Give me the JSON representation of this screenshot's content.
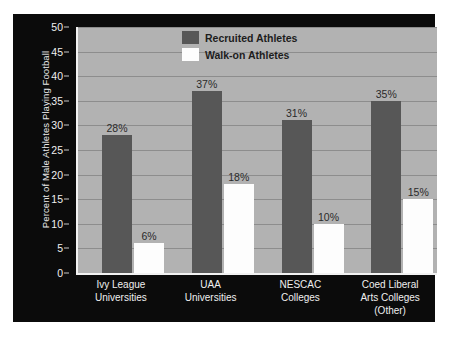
{
  "chart_data": {
    "type": "bar",
    "title": "",
    "subtitle": "",
    "xlabel": "",
    "ylabel": "Percent of Male Athletes Playing Football",
    "ylim": [
      0,
      50
    ],
    "ytick_step": 5,
    "yticks": [
      "0",
      "5",
      "10",
      "15",
      "20",
      "25",
      "30",
      "35",
      "40",
      "45",
      "50"
    ],
    "grid": true,
    "legend_position": "top-center",
    "categories": [
      "Ivy League Universities",
      "UAA Universities",
      "NESCAC Colleges",
      "Coed Liberal Arts Colleges (Other)"
    ],
    "category_lines": [
      [
        "Ivy League",
        "Universities"
      ],
      [
        "UAA",
        "Universities"
      ],
      [
        "NESCAC",
        "Colleges"
      ],
      [
        "Coed Liberal",
        "Arts Colleges",
        "(Other)"
      ]
    ],
    "series": [
      {
        "name": "Recruited Athletes",
        "color": "#575757",
        "values": [
          28,
          37,
          31,
          35
        ],
        "labels": [
          "28%",
          "37%",
          "31%",
          "35%"
        ]
      },
      {
        "name": "Walk-on Athletes",
        "color": "#fdfdfd",
        "values": [
          6,
          18,
          10,
          15
        ],
        "labels": [
          "6%",
          "18%",
          "10%",
          "15%"
        ]
      }
    ]
  },
  "style": {
    "panel_background": "#0b0b0b",
    "plot_background": "#b2b2b2",
    "gridline_color": "#8d8d8d",
    "axis_color": "#f2f2f2",
    "tick_text_color": "#f0f0f0",
    "category_text_color": "#efefef",
    "value_label_color": "#2a2a2a",
    "legend_text_color": "#1d1d1d",
    "page_background": "#ffffff"
  }
}
